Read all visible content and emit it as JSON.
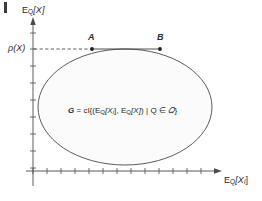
{
  "figure": {
    "title_visible": false,
    "background_color": "#ffffff",
    "ink_color": "#3a3a3a",
    "region_fill_color": "#fbfbfb"
  },
  "axes": {
    "y_axis": {
      "label_main": "E",
      "label_sub": "Q",
      "label_bracket": "[X]",
      "label_full": "E_Q[X]",
      "tick_count": 9,
      "arrow": true
    },
    "x_axis": {
      "label_main": "E",
      "label_sub": "Q",
      "label_bracket": "[X",
      "label_bracket_sub": "i",
      "label_bracket_close": "]",
      "label_full": "E_Q[X_i]",
      "tick_count": 13,
      "arrow": true
    }
  },
  "markers": {
    "rho_label": "ρ(X)",
    "point_a_label": "A",
    "point_b_label": "B",
    "dashed_guide": true,
    "chord_label": "A-B chord"
  },
  "equation": {
    "lhs": "G",
    "eq_sign": "=",
    "operator": "cl",
    "open_brace": "{",
    "first_term_main": "E",
    "first_term_sub": "Q",
    "first_term_arg": "[X",
    "first_term_arg_sub": "i",
    "first_term_arg_close": "]",
    "comma": ",",
    "second_term_main": "E",
    "second_term_sub": "Q",
    "second_term_arg": "[X]",
    "divider": "|",
    "member": "Q",
    "in_symbol": "∈",
    "set": "𝑄",
    "close_brace": "}",
    "full_text": "G = cl{(E_Q[X_i], E_Q[X]) | Q ∈ 𝑄}"
  },
  "geometry": {
    "region_shape": "ellipse",
    "region_center_x": 125,
    "region_center_y": 107,
    "region_radius_x": 87,
    "region_radius_y": 58,
    "point_a_x": 92,
    "point_a_y": 49,
    "point_b_x": 160,
    "point_b_y": 49,
    "y_axis_x": 33,
    "x_axis_y": 171,
    "rho_level_y": 49
  }
}
